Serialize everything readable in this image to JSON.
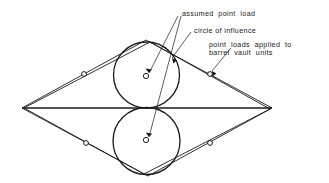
{
  "diagram": {
    "background_color": "#ffffff",
    "line_color": "#1a1a1a",
    "text_color": "#1a1a1a",
    "annotations": {
      "assumed_point_load": "assumed  point  load",
      "circle_of_influence": "circle of influence",
      "point_loads_line1": "point  loads  applied  to",
      "point_loads_line2": "barrel  vault  units"
    },
    "geometry": {
      "outer_rhombus": {
        "left_vertex": [
          22,
          108
        ],
        "top_vertex": [
          146,
          40
        ],
        "right_vertex": [
          272,
          108
        ],
        "bottom_vertex": [
          148,
          176
        ]
      },
      "inner_rhombus": {
        "left_vertex": [
          24,
          108
        ],
        "top_vertex": [
          150,
          42
        ],
        "right_vertex": [
          270,
          109
        ],
        "bottom_vertex": [
          144,
          174
        ]
      },
      "centerline": {
        "from": [
          22,
          108
        ],
        "to": [
          272,
          108
        ]
      },
      "upper_circle": {
        "cx": 146.5,
        "cy": 75,
        "r": 33
      },
      "lower_circle": {
        "cx": 146.5,
        "cy": 141,
        "r": 33.5
      },
      "load_markers": [
        {
          "name": "upper-circle-center",
          "cx": 146,
          "cy": 76,
          "r": 2.6
        },
        {
          "name": "lower-circle-center",
          "cx": 146,
          "cy": 140,
          "r": 2.6
        },
        {
          "name": "edge-upper-left",
          "cx": 84,
          "cy": 74,
          "r": 2.4
        },
        {
          "name": "edge-upper-right",
          "cx": 210,
          "cy": 74,
          "r": 2.4
        },
        {
          "name": "edge-lower-left",
          "cx": 86,
          "cy": 143,
          "r": 2.4
        },
        {
          "name": "edge-lower-right",
          "cx": 210,
          "cy": 143,
          "r": 2.4
        }
      ],
      "leaders": {
        "assumed_to_upper": {
          "from": [
            178,
            14
          ],
          "to": [
            149,
            73
          ]
        },
        "assumed_to_lower": {
          "from": [
            180,
            14
          ],
          "to": [
            149,
            137
          ]
        },
        "influence_to_circle": {
          "from": [
            190,
            31
          ],
          "to": [
            172,
            58
          ]
        },
        "pointloads_to_marker": {
          "from": [
            230,
            47
          ],
          "to": [
            212,
            71
          ]
        }
      },
      "text_positions": {
        "assumed_point_load": [
          182,
          14
        ],
        "circle_of_influence": [
          193,
          31
        ],
        "point_loads_line1": [
          208,
          45
        ],
        "point_loads_line2": [
          208,
          53
        ]
      }
    }
  }
}
